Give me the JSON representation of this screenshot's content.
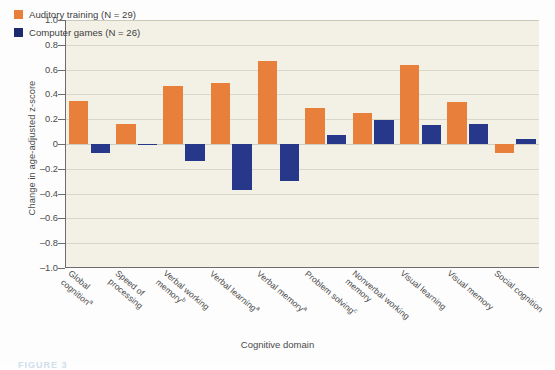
{
  "chart_data": {
    "type": "bar",
    "title": "",
    "xlabel": "Cognitive domain",
    "ylabel": "Change in age-adjusted z-score",
    "ylim": [
      -1.0,
      1.0
    ],
    "ytick_labels": [
      "1.0",
      "0.8",
      "0.6",
      "0.4",
      "0.2",
      "0",
      "–0.2",
      "–0.4",
      "–0.6",
      "–0.8",
      "–1.0"
    ],
    "ytick_values": [
      1.0,
      0.8,
      0.6,
      0.4,
      0.2,
      0,
      -0.2,
      -0.4,
      -0.6,
      -0.8,
      -1.0
    ],
    "grid": true,
    "legend_position": "top-left",
    "categories": [
      "Global cognition",
      "Speed of processing",
      "Verbal working memory",
      "Verbal learning",
      "Verbal memory",
      "Problem solving",
      "Nonverbal working memory",
      "Visual learning",
      "Visual memory",
      "Social cognition"
    ],
    "category_labels": [
      {
        "line1": "Global",
        "line2": "cognition",
        "sup": "a"
      },
      {
        "line1": "Speed of",
        "line2": "processing",
        "sup": ""
      },
      {
        "line1": "Verbal working",
        "line2": "memory",
        "sup": "b"
      },
      {
        "line1": "Verbal learning",
        "line2": "",
        "sup": "a"
      },
      {
        "line1": "Verbal memory",
        "line2": "",
        "sup": "a"
      },
      {
        "line1": "Problem solving",
        "line2": "",
        "sup": "c"
      },
      {
        "line1": "Nonverbal working",
        "line2": "memory",
        "sup": ""
      },
      {
        "line1": "Visual learning",
        "line2": "",
        "sup": ""
      },
      {
        "line1": "Visual memory",
        "line2": "",
        "sup": ""
      },
      {
        "line1": "Social cognition",
        "line2": "",
        "sup": ""
      }
    ],
    "series": [
      {
        "name": "Auditory training (N = 29)",
        "color": "#e8803c",
        "values": [
          0.35,
          0.16,
          0.47,
          0.49,
          0.67,
          0.29,
          0.25,
          0.64,
          0.34,
          -0.07
        ]
      },
      {
        "name": "Computer games (N = 26)",
        "color": "#27388b",
        "values": [
          -0.07,
          -0.01,
          -0.14,
          -0.37,
          -0.3,
          0.07,
          0.19,
          0.15,
          0.16,
          0.04
        ]
      }
    ]
  },
  "legend": {
    "items": [
      {
        "label": "Auditory training (N = 29)",
        "color": "#e8803c"
      },
      {
        "label": "Computer games (N = 26)",
        "color": "#1d2b6e"
      }
    ]
  },
  "axes": {
    "y_title": "Change in age-adjusted z-score",
    "x_title": "Cognitive domain"
  },
  "caption": "FIGURE 3"
}
